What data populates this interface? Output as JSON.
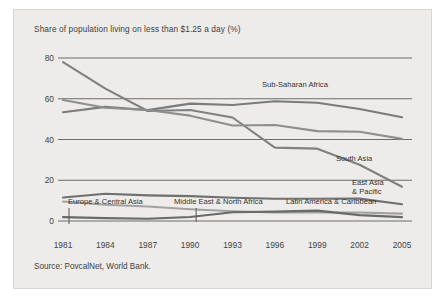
{
  "chart_data": {
    "type": "line",
    "title": "Share of population living on less than $1.25 a day (%)",
    "source": "Source: PovcalNet, World Bank.",
    "xlabel": "",
    "ylabel": "",
    "x": [
      1981,
      1984,
      1987,
      1990,
      1993,
      1996,
      1999,
      2002,
      2005
    ],
    "xticks": [
      "1981",
      "1984",
      "1987",
      "1990",
      "1993",
      "1996",
      "1999",
      "2002",
      "2005"
    ],
    "yticks": [
      "0",
      "20",
      "40",
      "60",
      "80"
    ],
    "ytick_values": [
      0,
      20,
      40,
      60,
      80
    ],
    "ylim": [
      0,
      84
    ],
    "xlim": [
      1981,
      2005
    ],
    "grid": "horizontal",
    "legend": "inline-labels",
    "series": [
      {
        "name": "East Asia & Pacific",
        "label": "East Asia\n& Pacific",
        "label_line1": "East Asia",
        "label_line2": "& Pacific",
        "color": "#808080",
        "values": [
          78.0,
          65.0,
          54.0,
          54.5,
          50.8,
          36.0,
          35.5,
          27.6,
          16.8
        ]
      },
      {
        "name": "Sub-Saharan Africa",
        "label": "Sub-Saharan Africa",
        "color": "#7b7b7b",
        "values": [
          53.4,
          56.0,
          54.4,
          57.6,
          56.9,
          58.8,
          58.0,
          55.0,
          50.9
        ]
      },
      {
        "name": "South Asia",
        "label": "South Asia",
        "color": "#8e8e8e",
        "values": [
          59.4,
          55.6,
          54.5,
          51.7,
          46.9,
          47.1,
          44.1,
          43.8,
          40.3
        ]
      },
      {
        "name": "Latin America & Caribbean",
        "label": "Latin America & Caribbean",
        "color": "#6f6f6f",
        "values": [
          11.5,
          13.4,
          12.6,
          12.2,
          11.4,
          10.9,
          10.9,
          11.0,
          8.2
        ]
      },
      {
        "name": "Middle East & North Africa",
        "label": "Middle East & North Africa",
        "color": "#a2a2a2",
        "values": [
          9.6,
          8.0,
          7.1,
          5.8,
          4.8,
          4.2,
          4.2,
          4.2,
          3.6
        ]
      },
      {
        "name": "Europe & Central Asia",
        "label": "Europe & Central Asia",
        "color": "#6a6a6a",
        "values": [
          1.9,
          1.4,
          1.1,
          2.0,
          4.3,
          4.6,
          5.1,
          2.9,
          1.9
        ]
      }
    ],
    "annotations": [
      {
        "text": "Europe & Central Asia",
        "leader_year": 1981
      },
      {
        "text": "Middle East & North Africa",
        "leader_year": 1990
      },
      {
        "text": "Latin America & Caribbean",
        "leader_year": 1999
      }
    ]
  }
}
